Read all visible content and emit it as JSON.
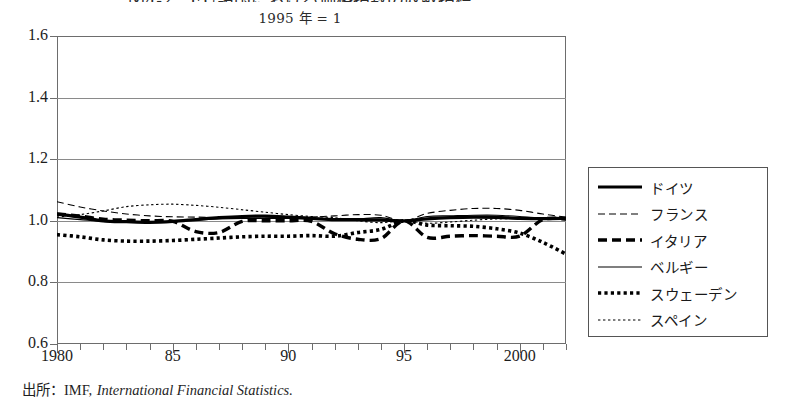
{
  "figure": {
    "title": "図4-2　EU諸国における価格指数の収斂指標",
    "subtitle": "1995 年 = 1",
    "source_prefix": "出所：IMF,",
    "source_italic": "International Financial Statistics."
  },
  "chart_data": {
    "type": "line",
    "title": "図4-2　EU諸国における価格指数の収斂指標",
    "subtitle": "1995 年 = 1",
    "xlabel": "",
    "ylabel": "",
    "xlim": [
      1980,
      2002
    ],
    "ylim": [
      0.6,
      1.6
    ],
    "yticks": [
      "1.6",
      "1.4",
      "1.2",
      "1.0",
      "0.8",
      "0.6"
    ],
    "ytick_values": [
      1.6,
      1.4,
      1.2,
      1.0,
      0.8,
      0.6
    ],
    "xticks": [
      "1980",
      "85",
      "90",
      "95",
      "2000"
    ],
    "xtick_values": [
      1980,
      1985,
      1990,
      1995,
      2000
    ],
    "minor_xticks": "every year 1980-2002",
    "grid": "horizontal gridlines at each y tick",
    "legend_position": "right outside plot",
    "x": [
      1980,
      1981,
      1982,
      1983,
      1984,
      1985,
      1986,
      1987,
      1988,
      1989,
      1990,
      1991,
      1992,
      1993,
      1994,
      1995,
      1996,
      1997,
      1998,
      1999,
      2000,
      2001,
      2002
    ],
    "series": [
      {
        "name": "ドイツ",
        "style": "thick-solid",
        "color": "#000000",
        "values": [
          1.022,
          1.012,
          1.0,
          0.997,
          0.995,
          0.998,
          1.004,
          1.01,
          1.014,
          1.015,
          1.012,
          1.008,
          1.004,
          1.004,
          1.003,
          1.0,
          1.006,
          1.01,
          1.012,
          1.011,
          1.008,
          1.007,
          1.008
        ]
      },
      {
        "name": "フランス",
        "style": "thin-dashed",
        "color": "#000000",
        "values": [
          1.062,
          1.045,
          1.032,
          1.022,
          1.016,
          1.013,
          1.012,
          1.01,
          1.008,
          1.008,
          1.01,
          1.012,
          1.016,
          1.02,
          1.018,
          1.0,
          1.024,
          1.034,
          1.04,
          1.04,
          1.034,
          1.022,
          1.012
        ]
      },
      {
        "name": "イタリア",
        "style": "thick-dashed",
        "color": "#000000",
        "values": [
          1.022,
          1.015,
          1.005,
          1.002,
          1.0,
          0.998,
          0.965,
          0.962,
          0.998,
          1.0,
          1.0,
          0.998,
          0.958,
          0.94,
          0.942,
          1.0,
          0.946,
          0.95,
          0.952,
          0.95,
          0.95,
          1.004,
          1.006
        ]
      },
      {
        "name": "ベルギー",
        "style": "thin-solid",
        "color": "#000000",
        "values": [
          1.01,
          1.004,
          0.998,
          0.996,
          0.996,
          0.998,
          1.002,
          1.006,
          1.008,
          1.008,
          1.008,
          1.006,
          1.004,
          1.006,
          1.01,
          1.0,
          1.014,
          1.016,
          1.018,
          1.018,
          1.014,
          1.008,
          1.006
        ]
      },
      {
        "name": "スウェーデン",
        "style": "thick-dotted",
        "color": "#000000",
        "values": [
          0.955,
          0.948,
          0.938,
          0.934,
          0.934,
          0.936,
          0.94,
          0.944,
          0.948,
          0.95,
          0.95,
          0.952,
          0.95,
          0.962,
          0.972,
          1.0,
          0.986,
          0.984,
          0.982,
          0.974,
          0.96,
          0.93,
          0.892
        ]
      },
      {
        "name": "スペイン",
        "style": "thin-dotted",
        "color": "#000000",
        "values": [
          1.012,
          1.02,
          1.032,
          1.046,
          1.052,
          1.054,
          1.05,
          1.044,
          1.036,
          1.028,
          1.02,
          1.014,
          1.01,
          1.0,
          0.994,
          1.0,
          0.992,
          0.996,
          1.002,
          1.006,
          1.008,
          1.008,
          1.008
        ]
      }
    ]
  },
  "legend": {
    "items": [
      {
        "label": "ドイツ",
        "style": "thick-solid"
      },
      {
        "label": "フランス",
        "style": "thin-dashed"
      },
      {
        "label": "イタリア",
        "style": "thick-dashed"
      },
      {
        "label": "ベルギー",
        "style": "thin-solid"
      },
      {
        "label": "スウェーデン",
        "style": "thick-dotted"
      },
      {
        "label": "スペイン",
        "style": "thin-dotted"
      }
    ]
  },
  "axes": {
    "y_labels": [
      "1.6",
      "1.4",
      "1.2",
      "1.0",
      "0.8",
      "0.6"
    ],
    "x_labels": [
      "1980",
      "85",
      "90",
      "95",
      "2000"
    ]
  }
}
